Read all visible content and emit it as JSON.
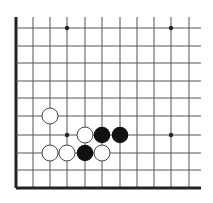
{
  "board": {
    "type": "go-board-corner-diagram",
    "corner": "bottom-left",
    "columns_visible": 11,
    "rows_visible": 10,
    "colors": {
      "background": "#ffffff",
      "grid_line": "#555555",
      "edge_line": "#222222",
      "black_stone": "#111111",
      "white_stone_fill": "#ffffff",
      "white_stone_stroke": "#333333",
      "star_point": "#222222"
    },
    "grid": {
      "x": [
        16,
        33,
        50,
        67,
        85,
        102,
        120,
        137,
        154,
        171,
        189
      ],
      "y": [
        28,
        46,
        63,
        81,
        98,
        116,
        135,
        153,
        170,
        188
      ],
      "x_end": 201,
      "y_start": 17
    },
    "star_points": [
      {
        "col": 3,
        "row": 0
      },
      {
        "col": 9,
        "row": 0
      },
      {
        "col": 3,
        "row": 6
      },
      {
        "col": 9,
        "row": 6
      }
    ],
    "stones": [
      {
        "color": "white",
        "col": 2,
        "row": 5
      },
      {
        "color": "white",
        "col": 4,
        "row": 6
      },
      {
        "color": "black",
        "col": 5,
        "row": 6
      },
      {
        "color": "black",
        "col": 6,
        "row": 6
      },
      {
        "color": "white",
        "col": 2,
        "row": 7
      },
      {
        "color": "white",
        "col": 3,
        "row": 7
      },
      {
        "color": "black",
        "col": 4,
        "row": 7
      },
      {
        "color": "white",
        "col": 5,
        "row": 7
      }
    ]
  }
}
